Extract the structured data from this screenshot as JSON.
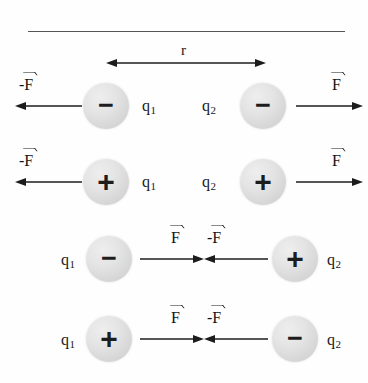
{
  "figure": {
    "distance_label": "r",
    "rule_color": "#55565a",
    "sphere_color": "#dcdcdc",
    "ink_color": "#1c1c1c",
    "background": "#fefefe"
  },
  "rows": [
    {
      "id": "row-like-negative",
      "description": "Two negative charges repel each other",
      "has_distance_arrow": true,
      "left": {
        "charge_sign": "−",
        "charge_polarity": "negative",
        "charge_label": "q",
        "charge_subscript": "1",
        "label_side": "right",
        "force_label_prefix": "-",
        "force_label_symbol": "F",
        "force_direction": "left"
      },
      "right": {
        "charge_sign": "−",
        "charge_polarity": "negative",
        "charge_label": "q",
        "charge_subscript": "2",
        "label_side": "left",
        "force_label_prefix": "",
        "force_label_symbol": "F",
        "force_direction": "right"
      }
    },
    {
      "id": "row-like-positive",
      "description": "Two positive charges repel each other",
      "has_distance_arrow": false,
      "left": {
        "charge_sign": "+",
        "charge_polarity": "positive",
        "charge_label": "q",
        "charge_subscript": "1",
        "label_side": "right",
        "force_label_prefix": "-",
        "force_label_symbol": "F",
        "force_direction": "left"
      },
      "right": {
        "charge_sign": "+",
        "charge_polarity": "positive",
        "charge_label": "q",
        "charge_subscript": "2",
        "label_side": "left",
        "force_label_prefix": "",
        "force_label_symbol": "F",
        "force_direction": "right"
      }
    },
    {
      "id": "row-unlike-negative-positive",
      "description": "A negative and a positive charge attract each other",
      "has_distance_arrow": false,
      "left": {
        "charge_sign": "−",
        "charge_polarity": "negative",
        "charge_label": "q",
        "charge_subscript": "1",
        "label_side": "left",
        "force_label_prefix": "",
        "force_label_symbol": "F",
        "force_direction": "right"
      },
      "right": {
        "charge_sign": "+",
        "charge_polarity": "positive",
        "charge_label": "q",
        "charge_subscript": "2",
        "label_side": "right",
        "force_label_prefix": "-",
        "force_label_symbol": "F",
        "force_direction": "left"
      }
    },
    {
      "id": "row-unlike-positive-negative",
      "description": "A positive and a negative charge attract each other",
      "has_distance_arrow": false,
      "left": {
        "charge_sign": "+",
        "charge_polarity": "positive",
        "charge_label": "q",
        "charge_subscript": "1",
        "label_side": "left",
        "force_label_prefix": "",
        "force_label_symbol": "F",
        "force_direction": "right"
      },
      "right": {
        "charge_sign": "−",
        "charge_polarity": "negative",
        "charge_label": "q",
        "charge_subscript": "2",
        "label_side": "right",
        "force_label_prefix": "-",
        "force_label_symbol": "F",
        "force_direction": "left"
      }
    }
  ]
}
